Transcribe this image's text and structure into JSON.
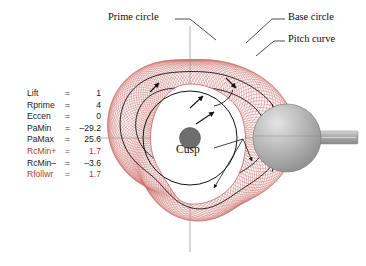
{
  "figure": {
    "type": "cam-profile-diagram",
    "background_color": "#ffffff",
    "envelope_color": "#c0504d",
    "contour_color": "#141414",
    "hub_color": "#6e6e6e",
    "roller_color": "#a8a8a8",
    "centerline_color": "#9a9a9a"
  },
  "parameters": {
    "rows": [
      {
        "name": "Lift",
        "eq": "=",
        "value": "1",
        "color": "#1a1a1a"
      },
      {
        "name": "Rprime",
        "eq": "=",
        "value": "4",
        "color": "#1a1a1a"
      },
      {
        "name": "Eccen",
        "eq": "=",
        "value": "0",
        "color": "#1a1a1a"
      },
      {
        "name": "PaMin",
        "eq": "=",
        "value": "–29.2",
        "color": "#1a1a1a"
      },
      {
        "name": "PaMax",
        "eq": "=",
        "value": "25.6",
        "color": "#1a1a1a"
      },
      {
        "name": "RcMin+",
        "eq": "=",
        "value": "1.7",
        "color": "#c0392b"
      },
      {
        "name": "RcMin–",
        "eq": "=",
        "value": "–3.6",
        "color": "#1a1a1a"
      },
      {
        "name": "Rfollwr",
        "eq": "=",
        "value": "1.7",
        "color": "#c0392b"
      }
    ]
  },
  "labels": {
    "prime_circle": "Prime circle",
    "base_circle": "Base circle",
    "pitch_curve": "Pitch curve",
    "cusp": "Cusp"
  },
  "chart_data": {
    "type": "line",
    "title": "",
    "xlabel": "",
    "ylabel": "",
    "annotations": [
      "Prime circle",
      "Base circle",
      "Pitch curve",
      "Cusp"
    ],
    "series": [
      {
        "name": "Lift",
        "values": [
          1
        ]
      },
      {
        "name": "Rprime",
        "values": [
          4
        ]
      },
      {
        "name": "Eccen",
        "values": [
          0
        ]
      },
      {
        "name": "PaMin",
        "values": [
          -29.2
        ]
      },
      {
        "name": "PaMax",
        "values": [
          25.6
        ]
      },
      {
        "name": "RcMin+",
        "values": [
          1.7
        ]
      },
      {
        "name": "RcMin-",
        "values": [
          -3.6
        ]
      },
      {
        "name": "Rfollwr",
        "values": [
          1.7
        ]
      }
    ]
  }
}
